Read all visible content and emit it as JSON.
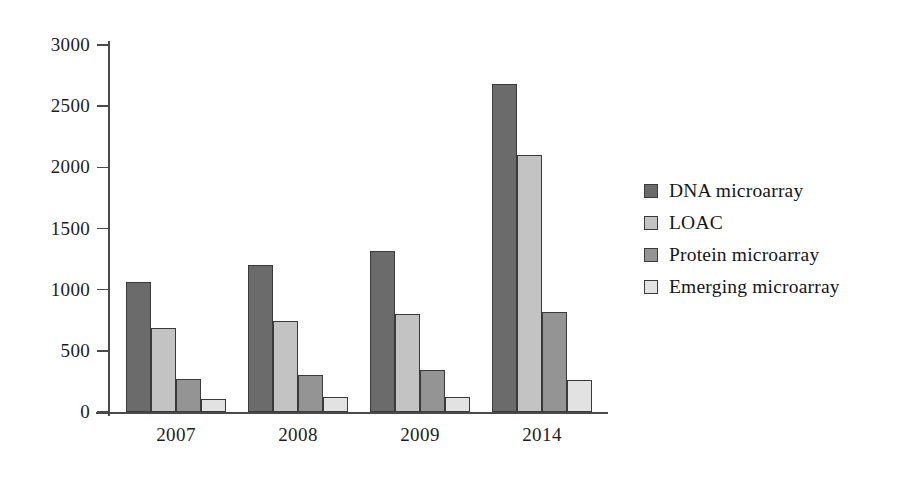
{
  "chart_data": {
    "type": "bar",
    "title": "",
    "xlabel": "",
    "ylabel": "",
    "categories": [
      "2007",
      "2008",
      "2009",
      "2014"
    ],
    "series": [
      {
        "name": "DNA microarray",
        "color": "#6b6b6b",
        "values": [
          1060,
          1205,
          1320,
          2680
        ]
      },
      {
        "name": "LOAC",
        "color": "#c3c3c3",
        "values": [
          685,
          740,
          800,
          2100
        ]
      },
      {
        "name": "Protein microarray",
        "color": "#949494",
        "values": [
          270,
          305,
          340,
          820
        ]
      },
      {
        "name": "Emerging microarray",
        "color": "#e2e2e2",
        "values": [
          110,
          125,
          120,
          265
        ]
      }
    ],
    "ylim": [
      0,
      3000
    ],
    "yticks": [
      0,
      500,
      1000,
      1500,
      2000,
      2500,
      3000
    ],
    "ytick_labels": [
      "0",
      "500",
      "1000",
      "1500",
      "2000",
      "2500",
      "3000"
    ],
    "grid": false,
    "legend_position": "right",
    "bar_outline_color": "#3a3a3a",
    "axis_color": "#4a4a4a",
    "background": "#ffffff"
  },
  "legend": {
    "items": [
      {
        "label": "DNA microarray",
        "swatch": "#6b6b6b"
      },
      {
        "label": "LOAC",
        "swatch": "#c3c3c3"
      },
      {
        "label": "Protein microarray",
        "swatch": "#949494"
      },
      {
        "label": "Emerging microarray",
        "swatch": "#e2e2e2"
      }
    ]
  }
}
